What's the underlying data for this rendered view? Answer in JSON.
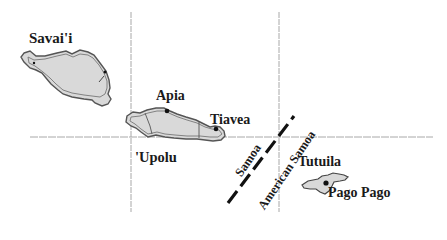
{
  "map": {
    "colors": {
      "land_fill": "#d9d9d9",
      "coast": "#555555",
      "grid": "#a8a8a8",
      "boundary": "#111111",
      "text": "#1a1a1a"
    },
    "islands": [
      {
        "name": "Savai'i"
      },
      {
        "name": "'Upolu"
      },
      {
        "name": "Tutuila"
      }
    ],
    "places": [
      {
        "name": "Apia",
        "type": "city-dot"
      },
      {
        "name": "Tiavea",
        "type": "city-dot"
      },
      {
        "name": "Pago Pago",
        "type": "city-dot"
      }
    ],
    "boundary": {
      "left_label": "Samoa",
      "right_label": "American Samoa",
      "style": "dashed"
    },
    "labels": {
      "savaii": "Savai'i",
      "apia": "Apia",
      "tiavea": "Tiavea",
      "upolu": "'Upolu",
      "tutuila": "Tutuila",
      "pago_pago": "Pago Pago",
      "samoa": "Samoa",
      "american_samoa": "American Samoa"
    }
  }
}
